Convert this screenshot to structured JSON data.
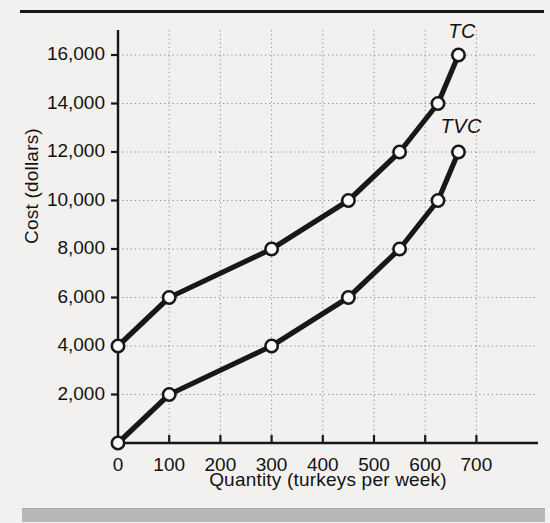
{
  "figure": {
    "background_color": "#f2f1ef",
    "ink_color": "#181818",
    "accent_bar_color": "#b9b8b6"
  },
  "chart_data": {
    "type": "line",
    "title": "",
    "xlabel": "Quantity (turkeys per week)",
    "ylabel": "Cost (dollars)",
    "xlim": [
      0,
      740
    ],
    "ylim": [
      0,
      17000
    ],
    "grid": true,
    "legend_position": "inline-end-of-line",
    "xticks": [
      0,
      100,
      200,
      300,
      400,
      500,
      600,
      700
    ],
    "xtick_labels": [
      "0",
      "100",
      "200",
      "300",
      "400",
      "500",
      "600",
      "700"
    ],
    "yticks": [
      2000,
      4000,
      6000,
      8000,
      10000,
      12000,
      14000,
      16000
    ],
    "ytick_labels": [
      "2,000",
      "4,000",
      "6,000",
      "8,000",
      "10,000",
      "12,000",
      "14,000",
      "16,000"
    ],
    "marker": "open-circle",
    "series": [
      {
        "name": "TC",
        "label": "TC",
        "label_x": 645,
        "label_y": 16900,
        "x": [
          0,
          100,
          300,
          450,
          550,
          625,
          665
        ],
        "y": [
          4000,
          6000,
          8000,
          10000,
          12000,
          14000,
          16000
        ]
      },
      {
        "name": "TVC",
        "label": "TVC",
        "label_x": 630,
        "label_y": 13000,
        "x": [
          0,
          100,
          300,
          450,
          550,
          625,
          665
        ],
        "y": [
          0,
          2000,
          4000,
          6000,
          8000,
          10000,
          12000
        ]
      }
    ]
  },
  "axis_labels": {
    "y": "Cost (dollars)",
    "x": "Quantity (turkeys per week)"
  }
}
